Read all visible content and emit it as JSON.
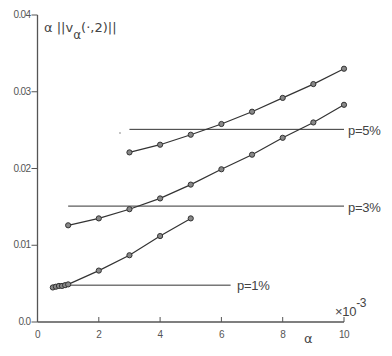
{
  "chart_data": {
    "type": "line",
    "title": "",
    "xlabel": "α",
    "x_multiplier": "×10⁻³",
    "ylabel": "α ||v_α(·,2)||",
    "xlim": [
      0,
      10
    ],
    "ylim": [
      0.0,
      0.04
    ],
    "x_ticks": [
      0,
      2,
      4,
      6,
      8,
      10
    ],
    "x_tick_labels": [
      "0",
      "2",
      "4",
      "6",
      "8",
      "10"
    ],
    "y_ticks": [
      0.0,
      0.01,
      0.02,
      0.03,
      0.04
    ],
    "y_tick_labels": [
      "0.0",
      "0.01",
      "0.02",
      "0.03",
      "0.04"
    ],
    "grid": false,
    "legend": null,
    "series": [
      {
        "name": "p=1%",
        "marker": "circle",
        "x": [
          0.5,
          0.6,
          0.7,
          0.8,
          0.9,
          1.0,
          2,
          3,
          4,
          5
        ],
        "values": [
          0.0045,
          0.0046,
          0.0047,
          0.0047,
          0.0048,
          0.0049,
          0.0067,
          0.0087,
          0.0112,
          0.0135
        ]
      },
      {
        "name": "p=3%",
        "marker": "circle",
        "x": [
          1,
          2,
          3,
          4,
          5,
          6,
          7,
          8,
          9,
          10
        ],
        "values": [
          0.0126,
          0.0135,
          0.0147,
          0.0161,
          0.0179,
          0.0199,
          0.0218,
          0.024,
          0.026,
          0.0283
        ]
      },
      {
        "name": "p=5%",
        "marker": "circle",
        "x": [
          3,
          4,
          5,
          6,
          7,
          8,
          9,
          10
        ],
        "values": [
          0.0221,
          0.0231,
          0.0244,
          0.0258,
          0.0274,
          0.0292,
          0.031,
          0.033
        ]
      }
    ],
    "reference_lines": [
      {
        "label": "p=1%",
        "y": 0.0048,
        "x_start": 0.5,
        "x_end": 6.3
      },
      {
        "label": "p=3%",
        "y": 0.0151,
        "x_start": 1.0,
        "x_end": 10
      },
      {
        "label": "p=5%",
        "y": 0.0251,
        "x_start": 3.0,
        "x_end": 10
      }
    ],
    "annotations": [
      "p=1%",
      "p=3%",
      "p=5%",
      "×10⁻³"
    ]
  },
  "labels": {
    "y_axis_title_main": "α ||v",
    "y_axis_title_sub": "α",
    "y_axis_title_tail": "(·,2)||",
    "x_axis_title": "α",
    "x_multiplier_base": "×10",
    "x_multiplier_exp": "-3",
    "ann_p1": "p=1%",
    "ann_p3": "p=3%",
    "ann_p5": "p=5%"
  },
  "style": {
    "axis_color": "#555555",
    "line_color": "#333333",
    "marker_fill": "#888888",
    "text_color": "#444444"
  }
}
